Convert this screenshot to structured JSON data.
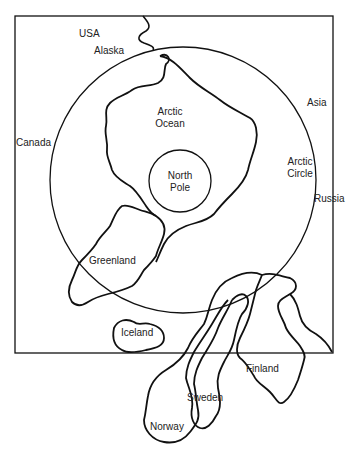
{
  "diagram": {
    "title": "",
    "labels": {
      "usa": "USA",
      "alaska": "Alaska",
      "canada": "Canada",
      "arctic_ocean_1": "Arctic",
      "arctic_ocean_2": "Ocean",
      "north_pole_1": "North",
      "north_pole_2": "Pole",
      "asia": "Asia",
      "arctic_circle_1": "Arctic",
      "arctic_circle_2": "Circle",
      "russia": "Russia",
      "greenland": "Greenland",
      "iceland": "Iceland",
      "finland": "Finland",
      "sweden": "Sweden",
      "norway": "Norway"
    },
    "colors": {
      "line": "#111111",
      "background": "#ffffff",
      "text": "#222222"
    }
  }
}
